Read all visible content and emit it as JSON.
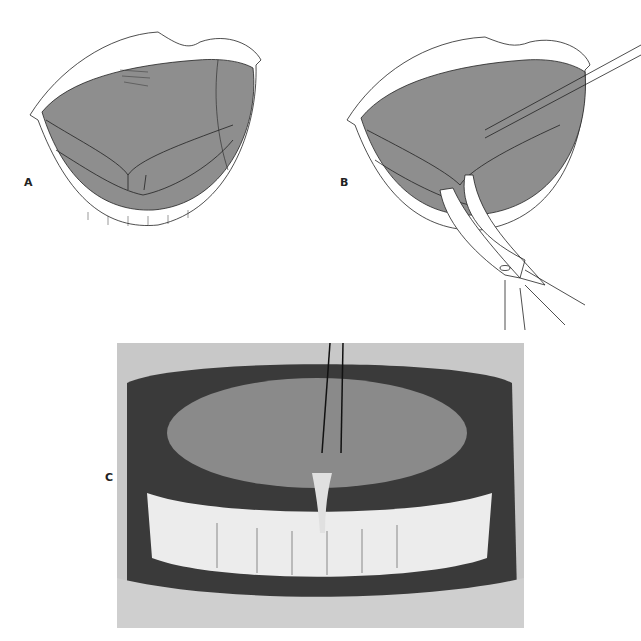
{
  "figure": {
    "panels": [
      {
        "id": "A",
        "label": "A",
        "description": "Illustration of open mouth with tongue raised, showing lingual frenum"
      },
      {
        "id": "B",
        "label": "B",
        "description": "Illustration of tongue elevated with suture while curved scissors incise the frenum"
      },
      {
        "id": "C",
        "label": "C",
        "description": "Clinical photograph of tongue retracted with suture showing lingual frenum and lower teeth"
      }
    ]
  },
  "colors": {
    "tissue_fill": "#8e8e8e",
    "line": "#1a1a1a",
    "background": "#ffffff"
  }
}
